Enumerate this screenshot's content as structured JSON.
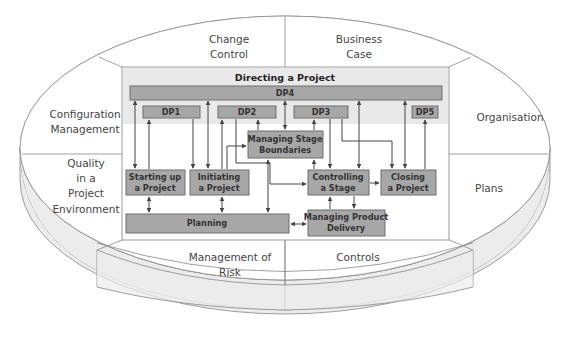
{
  "diagram": {
    "title": "Directing a Project",
    "outer_segments": [
      {
        "id": "change-control",
        "lines": [
          "Change",
          "Control"
        ]
      },
      {
        "id": "business-case",
        "lines": [
          "Business",
          "Case"
        ]
      },
      {
        "id": "configuration-management",
        "lines": [
          "Configuration",
          "Management"
        ]
      },
      {
        "id": "organisation",
        "lines": [
          "Organisation"
        ]
      },
      {
        "id": "quality",
        "lines": [
          "Quality",
          "in a",
          "Project",
          "Environment"
        ]
      },
      {
        "id": "plans",
        "lines": [
          "Plans"
        ]
      },
      {
        "id": "management-of-risk",
        "lines": [
          "Management of",
          "Risk"
        ]
      },
      {
        "id": "controls",
        "lines": [
          "Controls"
        ]
      }
    ],
    "directing": {
      "dp4": "DP4",
      "dp1": "DP1",
      "dp2": "DP2",
      "dp3": "DP3",
      "dp5": "DP5"
    },
    "processes": {
      "managing_stage_boundaries": [
        "Managing Stage",
        "Boundaries"
      ],
      "starting_up": [
        "Starting up",
        "a Project"
      ],
      "initiating": [
        "Initiating",
        "a Project"
      ],
      "controlling": [
        "Controlling",
        "a Stage"
      ],
      "closing": [
        "Closing",
        "a Project"
      ],
      "planning": "Planning",
      "managing_product_delivery": [
        "Managing Product",
        "Delivery"
      ]
    },
    "colors": {
      "box_fill": "#a7a7a7",
      "band_fill": "#e9e9e9",
      "rim_fill": "#ececec",
      "line": "#444444"
    }
  }
}
